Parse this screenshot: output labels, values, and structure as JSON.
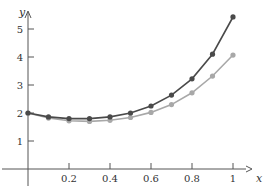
{
  "chart_data": {
    "type": "line",
    "title": "",
    "xlabel": "x",
    "ylabel": "y",
    "xlim": [
      0,
      1.05
    ],
    "ylim": [
      0,
      5.7
    ],
    "grid": false,
    "legend": null,
    "x_ticks": [
      "0.2",
      "0.4",
      "0.6",
      "0.8",
      "1"
    ],
    "y_ticks": [
      "1",
      "2",
      "3",
      "4",
      "5"
    ],
    "x": [
      0,
      0.1,
      0.2,
      0.3,
      0.4,
      0.5,
      0.6,
      0.7,
      0.8,
      0.9,
      1.0
    ],
    "series": [
      {
        "name": "upper",
        "color": "#4a4a4a",
        "values": [
          2.0,
          1.86,
          1.8,
          1.8,
          1.86,
          2.0,
          2.25,
          2.64,
          3.22,
          4.1,
          5.43
        ]
      },
      {
        "name": "lower",
        "color": "#a8a8a8",
        "values": [
          2.0,
          1.82,
          1.72,
          1.7,
          1.74,
          1.84,
          2.02,
          2.3,
          2.72,
          3.32,
          4.07
        ]
      }
    ]
  }
}
